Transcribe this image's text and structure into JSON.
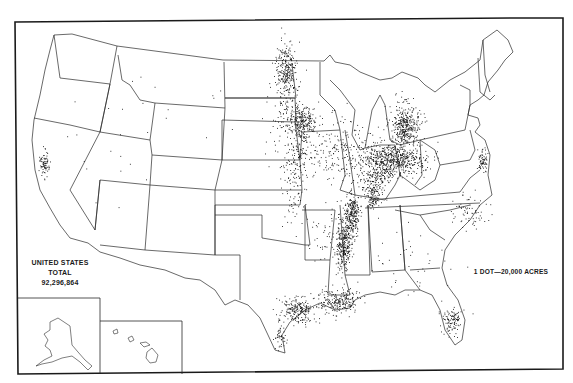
{
  "map": {
    "type": "dot-density",
    "region": "United States",
    "total": {
      "line1": "UNITED STATES",
      "line2": "TOTAL",
      "value": "92,296,864"
    },
    "legend": {
      "text": "1 DOT—20,000 ACRES"
    },
    "insets": [
      "Alaska",
      "Hawaii"
    ],
    "colors": {
      "dot": "#111111",
      "lines": "#2a2a2a",
      "background": "#ffffff"
    }
  },
  "dot_clusters": [
    {
      "name": "red-river-valley",
      "cx": 286,
      "cy": 68,
      "rx": 8,
      "ry": 22,
      "n": 220
    },
    {
      "name": "southern-minnesota",
      "cx": 302,
      "cy": 120,
      "rx": 12,
      "ry": 12,
      "n": 240
    },
    {
      "name": "south-dakota-east",
      "cx": 286,
      "cy": 100,
      "rx": 14,
      "ry": 30,
      "n": 120
    },
    {
      "name": "iowa-scatter",
      "cx": 300,
      "cy": 150,
      "rx": 20,
      "ry": 25,
      "n": 150
    },
    {
      "name": "missouri-river",
      "cx": 292,
      "cy": 180,
      "rx": 10,
      "ry": 40,
      "n": 90
    },
    {
      "name": "illinois-scatter",
      "cx": 340,
      "cy": 150,
      "rx": 22,
      "ry": 30,
      "n": 150
    },
    {
      "name": "michigan-thumb",
      "cx": 405,
      "cy": 125,
      "rx": 12,
      "ry": 18,
      "n": 380
    },
    {
      "name": "ohio-indiana",
      "cx": 390,
      "cy": 160,
      "rx": 28,
      "ry": 14,
      "n": 650
    },
    {
      "name": "indiana-south",
      "cx": 375,
      "cy": 180,
      "rx": 12,
      "ry": 12,
      "n": 140
    },
    {
      "name": "kentucky-missouri-bootheel",
      "cx": 372,
      "cy": 197,
      "rx": 6,
      "ry": 12,
      "n": 90
    },
    {
      "name": "mississippi-delta-north",
      "cx": 352,
      "cy": 215,
      "rx": 6,
      "ry": 18,
      "n": 260
    },
    {
      "name": "mississippi-delta-mid",
      "cx": 343,
      "cy": 245,
      "rx": 6,
      "ry": 22,
      "n": 280
    },
    {
      "name": "louisiana-coast",
      "cx": 340,
      "cy": 300,
      "rx": 18,
      "ry": 10,
      "n": 220
    },
    {
      "name": "texas-coast",
      "cx": 298,
      "cy": 310,
      "rx": 15,
      "ry": 10,
      "n": 220
    },
    {
      "name": "texas-coast-south",
      "cx": 280,
      "cy": 335,
      "rx": 5,
      "ry": 15,
      "n": 50
    },
    {
      "name": "florida-south",
      "cx": 452,
      "cy": 320,
      "rx": 8,
      "ry": 12,
      "n": 110
    },
    {
      "name": "california-central",
      "cx": 44,
      "cy": 163,
      "rx": 4,
      "ry": 10,
      "n": 80
    },
    {
      "name": "delmarva",
      "cx": 482,
      "cy": 160,
      "rx": 4,
      "ry": 10,
      "n": 70
    },
    {
      "name": "carolinas",
      "cx": 470,
      "cy": 210,
      "rx": 14,
      "ry": 14,
      "n": 70
    },
    {
      "name": "arkansas-oklahoma-scatter",
      "cx": 330,
      "cy": 235,
      "rx": 22,
      "ry": 25,
      "n": 60
    },
    {
      "name": "west-scatter",
      "cx": 150,
      "cy": 140,
      "rx": 100,
      "ry": 60,
      "n": 30
    },
    {
      "name": "southeast-scatter",
      "cx": 410,
      "cy": 260,
      "rx": 40,
      "ry": 30,
      "n": 40
    }
  ]
}
